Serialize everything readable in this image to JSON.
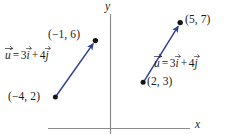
{
  "figure": {
    "background_color": "#ffffff",
    "width": 237,
    "height": 139,
    "vector_color": "#2a3f9d",
    "point_color": "#141414",
    "axis_color": "#8c8c8c",
    "text_color": "#1a1a1a"
  },
  "axes": {
    "x_label": "x",
    "y_label": "y",
    "origin_px": {
      "x": 110,
      "y": 128
    },
    "x_axis_px": {
      "x1": 48,
      "y1": 128,
      "x2": 190,
      "y2": 128
    },
    "y_axis_px": {
      "x1": 110,
      "y1": 14,
      "x2": 110,
      "y2": 134
    }
  },
  "equation": {
    "lhs": "u",
    "equals": "=",
    "coef_i": "3",
    "unit_i": "i",
    "plus": "+",
    "coef_j": "4",
    "unit_j": "j",
    "plain": "u = 3i + 4j"
  },
  "vectors": [
    {
      "id": "left-vector",
      "label": "u = 3i + 4j",
      "tail_point": {
        "label": "(-4, 2)",
        "display": "(−4, 2)",
        "x": -4,
        "y": 2,
        "px": {
          "x": 55,
          "y": 97
        }
      },
      "head_point": {
        "label": "(-1, 6)",
        "display": "(−1, 6)",
        "x": -1,
        "y": 6,
        "px": {
          "x": 95,
          "y": 41
        }
      },
      "components": {
        "i": 3,
        "j": 4
      }
    },
    {
      "id": "right-vector",
      "label": "u = 3i + 4j",
      "tail_point": {
        "label": "(2, 3)",
        "display": "(2, 3)",
        "x": 2,
        "y": 3,
        "px": {
          "x": 143,
          "y": 82
        }
      },
      "head_point": {
        "label": "(5, 7)",
        "display": "(5, 7)",
        "x": 5,
        "y": 7,
        "px": {
          "x": 180,
          "y": 23
        }
      },
      "components": {
        "i": 3,
        "j": 4
      }
    }
  ],
  "labels": {
    "left_head_coord": "(−1, 6)",
    "left_tail_coord": "(−4, 2)",
    "right_head_coord": "(5, 7)",
    "right_tail_coord": "(2, 3)"
  }
}
